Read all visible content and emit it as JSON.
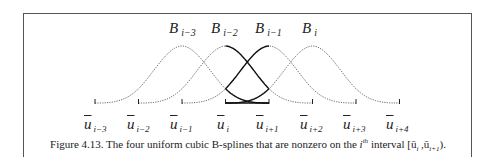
{
  "chart_data": {
    "type": "line",
    "knots": [
      "u_{i-3}",
      "u_{i-2}",
      "u_{i-1}",
      "u_i",
      "u_{i+1}",
      "u_{i+2}",
      "u_{i+3}",
      "u_{i+4}"
    ],
    "series": [
      {
        "name": "B_{i-3}",
        "support": [
          "u_{i-3}",
          "u_{i+1}"
        ],
        "style": "dotted, solid on [u_i,u_{i+1}]"
      },
      {
        "name": "B_{i-2}",
        "support": [
          "u_{i-2}",
          "u_{i+2}"
        ],
        "style": "dotted, solid on [u_i,u_{i+1}]"
      },
      {
        "name": "B_{i-1}",
        "support": [
          "u_{i-1}",
          "u_{i+3}"
        ],
        "style": "dotted, solid on [u_i,u_{i+1}]"
      },
      {
        "name": "B_i",
        "support": [
          "u_i",
          "u_{i+4}"
        ],
        "style": "dotted, solid on [u_i,u_{i+1}]"
      }
    ],
    "highlight_interval": [
      "u_i",
      "u_{i+1}"
    ]
  },
  "labels": {
    "b": [
      {
        "base": "B",
        "sub": "i−3"
      },
      {
        "base": "B",
        "sub": "i−2"
      },
      {
        "base": "B",
        "sub": "i−1"
      },
      {
        "base": "B",
        "sub": "i"
      }
    ],
    "knots": [
      {
        "base": "u",
        "sub": "i−3"
      },
      {
        "base": "u",
        "sub": "i−2"
      },
      {
        "base": "u",
        "sub": "i−1"
      },
      {
        "base": "u",
        "sub": "i"
      },
      {
        "base": "u",
        "sub": "i+1"
      },
      {
        "base": "u",
        "sub": "i+2"
      },
      {
        "base": "u",
        "sub": "i+3"
      },
      {
        "base": "u",
        "sub": "i+4"
      }
    ]
  },
  "caption": {
    "prefix": "Figure 4.13.  The four uniform cubic B-splines that are nonzero on the ",
    "i": "i",
    "sup": "th",
    "suffix": " interval [ū",
    "interval_text": "i",
    "mid": " ,ū",
    "interval_end": "i+1",
    "close": ")."
  }
}
